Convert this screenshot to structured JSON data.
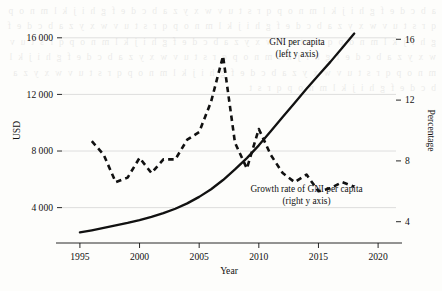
{
  "chart_data": {
    "type": "line",
    "title": "",
    "xlabel": "Year",
    "ylabel": "USD",
    "y2label": "Percentage",
    "xlim": [
      1993.5,
      2021.5
    ],
    "ylim": [
      1500,
      17400
    ],
    "y2lim": [
      2.6,
      17.4
    ],
    "xticks": [
      "1995",
      "2000",
      "2005",
      "2010",
      "2015",
      "2020"
    ],
    "xtick_values": [
      1995,
      2000,
      2005,
      2010,
      2015,
      2020
    ],
    "yticks": [
      "4000",
      "8000",
      "12000",
      "16000"
    ],
    "ytick_values": [
      4000,
      8000,
      12000,
      16000
    ],
    "y2ticks": [
      "4",
      "8",
      "12",
      "16"
    ],
    "y2tick_values": [
      4,
      8,
      12,
      16
    ],
    "grid": true,
    "grid_axis": "y",
    "legend": "annotations",
    "annotations": [
      {
        "name": "gni-per-capita-label",
        "line1": "GNI per capita",
        "line2": "(left y axis)",
        "x": 2013.2,
        "y_pct": 15.6
      },
      {
        "name": "growth-rate-label",
        "line1": "Growth rate of GNI per capita",
        "line2": "(right y axis)",
        "x": 2014.0,
        "y_pct": 5.95
      }
    ],
    "series": [
      {
        "name": "GNI per capita",
        "axis": "left",
        "style": "solid",
        "color": "#111111",
        "unit": "USD",
        "x": [
          1995,
          1996,
          1997,
          1998,
          1999,
          2000,
          2001,
          2002,
          2003,
          2004,
          2005,
          2006,
          2007,
          2008,
          2009,
          2010,
          2011,
          2012,
          2013,
          2014,
          2015,
          2016,
          2017,
          2018
        ],
        "values": [
          2250,
          2400,
          2570,
          2740,
          2920,
          3120,
          3350,
          3610,
          3920,
          4300,
          4760,
          5300,
          5950,
          6700,
          7500,
          8400,
          9400,
          10400,
          11400,
          12400,
          13350,
          14300,
          15300,
          16300
        ]
      },
      {
        "name": "Growth rate of GNI per capita",
        "axis": "right",
        "style": "dashed",
        "color": "#111111",
        "unit": "%",
        "x": [
          1996,
          1997,
          1998,
          1999,
          2000,
          2001,
          2002,
          2003,
          2004,
          2005,
          2006,
          2007,
          2008,
          2009,
          2010,
          2011,
          2012,
          2013,
          2014,
          2015,
          2016,
          2017,
          2018
        ],
        "values": [
          9.3,
          8.4,
          6.6,
          6.9,
          8.2,
          7.2,
          8.1,
          8.1,
          9.4,
          9.9,
          11.9,
          14.9,
          9.2,
          7.5,
          10.1,
          8.4,
          7.2,
          6.6,
          7.1,
          6.0,
          6.2,
          6.6,
          6.3
        ]
      }
    ]
  },
  "background_text": "a b c d e f g h i j k l m n o p q r s t u v w x y z a b c d e f g h i j k l m n o p q r s t u v w x y z a b c d e f g h i j k l m n o p q r s t u v w x y z a b c d e f g h i j k l m n o p q r s t u v w x y z a b c d e f g h i j k l m n o p q r s t u v w x y z a b c d e f g h i j k l m n o p q r s t u v w x y z a b c d e f g h i j k l m n o p q r s t u v w x y z a b c d e f g h i j k l m n o p q r s t u v w x y z a b c d e f g h i j k l m n o p q r s t"
}
